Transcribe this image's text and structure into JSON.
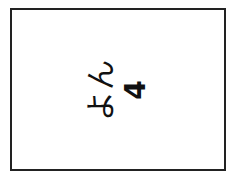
{
  "card": {
    "word": "よん",
    "numeral": "4",
    "rotation_deg": -90,
    "border_color": "#222222",
    "text_color": "#111111"
  }
}
